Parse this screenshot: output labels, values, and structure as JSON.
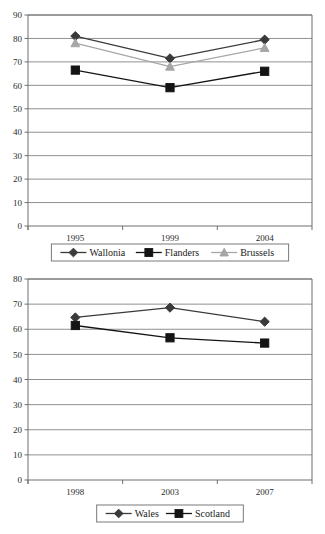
{
  "page": {
    "width": 325,
    "height": 534,
    "background": "#ffffff",
    "partial_cut_title": ""
  },
  "colors": {
    "dark_line": "#3a3a3a",
    "black_line": "#141414",
    "light_line": "#a6a6a6",
    "gridline": "#909090",
    "axis": "#6e6e6e",
    "text": "#1a1a1a"
  },
  "chart_data": [
    {
      "id": "chart-belgium",
      "type": "line",
      "title": "",
      "subtitle": "",
      "xlabel": "",
      "ylabel": "",
      "categories": [
        "1995",
        "1999",
        "2004"
      ],
      "ylim": [
        0,
        90
      ],
      "yticks": [
        0,
        10,
        20,
        30,
        40,
        50,
        60,
        70,
        80,
        90
      ],
      "ytick_labels": [
        "0",
        "10",
        "20",
        "30",
        "40",
        "50",
        "60",
        "70",
        "80",
        "90"
      ],
      "grid": true,
      "legend_position": "bottom",
      "series": [
        {
          "name": "Wallonia",
          "marker": "diamond",
          "color": "#3a3a3a",
          "values": [
            81,
            71.5,
            79.5
          ]
        },
        {
          "name": "Flanders",
          "marker": "square",
          "color": "#141414",
          "values": [
            66.5,
            59,
            66
          ]
        },
        {
          "name": "Brussels",
          "marker": "triangle",
          "color": "#a6a6a6",
          "values": [
            78,
            68,
            76
          ]
        }
      ]
    },
    {
      "id": "chart-uk",
      "type": "line",
      "title": "",
      "subtitle": "",
      "xlabel": "",
      "ylabel": "",
      "categories": [
        "1998",
        "2003",
        "2007"
      ],
      "ylim": [
        0,
        80
      ],
      "yticks": [
        0,
        10,
        20,
        30,
        40,
        50,
        60,
        70,
        80
      ],
      "ytick_labels": [
        "0",
        "10",
        "20",
        "30",
        "40",
        "50",
        "60",
        "70",
        "80"
      ],
      "grid": true,
      "legend_position": "bottom",
      "series": [
        {
          "name": "Wales",
          "marker": "diamond",
          "color": "#3a3a3a",
          "values": [
            64.7,
            68.6,
            63
          ]
        },
        {
          "name": "Scotland",
          "marker": "square",
          "color": "#141414",
          "values": [
            61.5,
            56.6,
            54.5
          ]
        }
      ]
    }
  ]
}
